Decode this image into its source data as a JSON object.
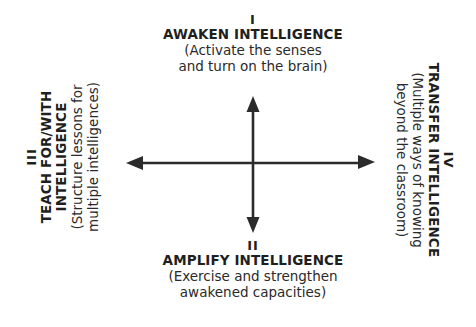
{
  "diagram": {
    "colors": {
      "arrow": "#2b2b2b",
      "text": "#1f1f1f",
      "background": "#ffffff"
    },
    "quadrants": {
      "top": {
        "numeral": "I",
        "title": "AWAKEN INTELLIGENCE",
        "desc_line1": "(Activate the senses",
        "desc_line2": "and turn on the brain)"
      },
      "bottom": {
        "numeral": "II",
        "title": "AMPLIFY INTELLIGENCE",
        "desc_line1": "(Exercise and strengthen",
        "desc_line2": "awakened capacities)"
      },
      "left": {
        "numeral": "III",
        "title_line1": "TEACH FOR/WITH",
        "title_line2": "INTELLIGENCE",
        "desc_line1": "(Structure lessons for",
        "desc_line2": "multiple intelligences)"
      },
      "right": {
        "numeral": "IV",
        "title": "TRANSFER INTELLIGENCE",
        "desc_line1": "(Multiple ways of knowing",
        "desc_line2": "beyond the classroom)"
      }
    },
    "arrows": {
      "vertical": {
        "x": 253,
        "y_top": 96,
        "y_bottom": 233
      },
      "horizontal": {
        "y": 163,
        "x_left": 126,
        "x_right": 375
      }
    }
  }
}
